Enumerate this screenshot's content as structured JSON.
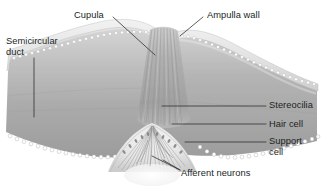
{
  "figure": {
    "style": "grayscale anatomical illustration",
    "background": "#ffffff"
  },
  "labels": {
    "semicircular_duct": "Semicircular\nduct",
    "cupula": "Cupula",
    "ampulla_wall": "Ampulla wall",
    "stereocilia": "Stereocilia",
    "hair_cell": "Hair cell",
    "support_cell": "Support\ncell",
    "afferent_neurons": "Afferent neurons"
  },
  "colors": {
    "text": "#201f1f",
    "leader_line": "#2b2a2a",
    "duct_lumen_light": "#d3d3d3",
    "duct_lumen_mid": "#b6b6b6",
    "duct_lumen_dark": "#9a9a9a",
    "ampulla_wall_band": "#e4e4e4",
    "wall_outline": "#bdbdbd",
    "cupula_fill": "#a9a9a9",
    "cupula_striation": "#8a8a8a",
    "crista_fill": "#e8e8e8",
    "epithelium_cell": "#ffffff",
    "epithelium_outline": "#a8a8a8",
    "nerve_fiber": "#9d9d9d"
  },
  "structures": [
    {
      "name": "semicircular-duct",
      "description": "tubular duct lumen extending left and right"
    },
    {
      "name": "ampulla-wall",
      "description": "arched outer wall of the ampulla"
    },
    {
      "name": "cupula",
      "description": "gelatinous dome with vertical striations rising from the crista"
    },
    {
      "name": "crista-ampullaris",
      "description": "mound of sensory epithelium at the base"
    },
    {
      "name": "stereocilia",
      "description": "hair bundles projecting into the cupula"
    },
    {
      "name": "hair-cell",
      "description": "sensory receptor cells in the crista"
    },
    {
      "name": "support-cell",
      "description": "supporting cells of the epithelium"
    },
    {
      "name": "afferent-neurons",
      "description": "nerve fibers beneath the crista"
    }
  ]
}
